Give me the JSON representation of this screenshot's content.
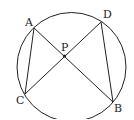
{
  "diagram": {
    "title": "",
    "shapes": [
      "circle"
    ],
    "points": {
      "A": {
        "label": "A"
      },
      "B": {
        "label": "B"
      },
      "C": {
        "label": "C"
      },
      "D": {
        "label": "D"
      },
      "P": {
        "label": "P"
      }
    },
    "segments": [
      "AB",
      "CD",
      "AC",
      "DB"
    ],
    "intersection": "P",
    "colors": {
      "stroke": "#222222",
      "background": "#ffffff"
    }
  }
}
